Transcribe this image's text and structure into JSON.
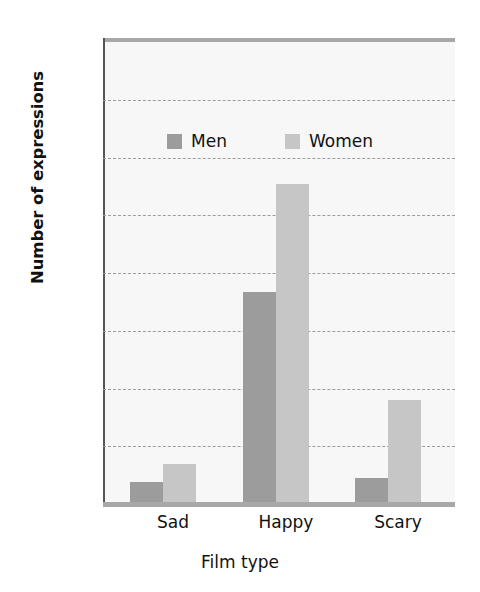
{
  "chart_data": {
    "type": "bar",
    "title": "",
    "categories": [
      "Sad",
      "Happy",
      "Scary"
    ],
    "series": [
      {
        "name": "Men",
        "values": [
          0.75,
          7.35,
          0.9
        ],
        "color": "#9c9c9c"
      },
      {
        "name": "Women",
        "values": [
          1.4,
          11.1,
          3.6
        ],
        "color": "#c6c6c6"
      }
    ],
    "xlabel": "Film type",
    "ylabel": "Number of expressions",
    "ylim": [
      0,
      16
    ],
    "yticks": [
      0,
      2,
      4,
      6,
      8,
      10,
      12,
      14,
      16
    ],
    "ytick_labels": [
      "0",
      "2",
      "4",
      "6",
      "8",
      "10",
      "12",
      "14",
      "16"
    ],
    "grid": true,
    "grid_axis": "y",
    "legend_position": "upper center",
    "legend_entries": [
      "Men",
      "Women"
    ]
  },
  "labels": {
    "ylabel": "Number of expressions",
    "xlabel": "Film type",
    "cat0": "Sad",
    "cat1": "Happy",
    "cat2": "Scary",
    "legend_men": "Men",
    "legend_women": "Women",
    "y0": "0",
    "y2": "2",
    "y4": "4",
    "y6": "6",
    "y8": "8",
    "y10": "10",
    "y12": "12",
    "y14": "14",
    "y16": "16"
  }
}
